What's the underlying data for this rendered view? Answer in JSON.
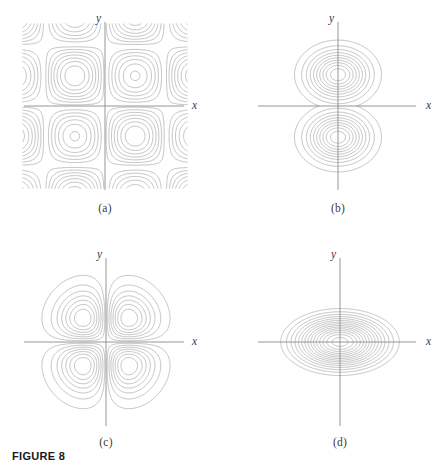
{
  "figure": {
    "caption": "FIGURE 8",
    "axis_label_x": "x",
    "axis_label_y": "y",
    "line_color": "#9b9b9b",
    "axis_color": "#8a8a8a",
    "text_color": "#3b3b3b",
    "background": "#ffffff"
  },
  "panels": [
    {
      "id": "a",
      "label": "(a)",
      "position": {
        "left": 0,
        "top": 0
      },
      "origin": {
        "x": 105,
        "y": 106
      },
      "axis_x": {
        "from": 24,
        "to": 184
      },
      "axis_y": {
        "from": 22,
        "to": 190
      },
      "x_label_pos": {
        "x": 192,
        "y": 109
      },
      "y_label_pos": {
        "x": 101,
        "y": 22
      }
    },
    {
      "id": "b",
      "label": "(b)",
      "position": {
        "left": 224,
        "top": 0
      },
      "origin": {
        "x": 114,
        "y": 106
      },
      "axis_x": {
        "from": 34,
        "to": 192
      },
      "axis_y": {
        "from": 22,
        "to": 190
      },
      "x_label_pos": {
        "x": 202,
        "y": 109
      },
      "y_label_pos": {
        "x": 110,
        "y": 22
      }
    },
    {
      "id": "c",
      "label": "(c)",
      "position": {
        "left": 0,
        "top": 234
      },
      "origin": {
        "x": 106,
        "y": 108
      },
      "axis_x": {
        "from": 24,
        "to": 184
      },
      "axis_y": {
        "from": 24,
        "to": 192
      },
      "x_label_pos": {
        "x": 192,
        "y": 111
      },
      "y_label_pos": {
        "x": 102,
        "y": 24
      }
    },
    {
      "id": "d",
      "label": "(d)",
      "position": {
        "left": 224,
        "top": 234
      },
      "origin": {
        "x": 116,
        "y": 108
      },
      "axis_x": {
        "from": 34,
        "to": 192
      },
      "axis_y": {
        "from": 24,
        "to": 192
      },
      "x_label_pos": {
        "x": 202,
        "y": 111
      },
      "y_label_pos": {
        "x": 112,
        "y": 24
      }
    }
  ],
  "chart_data": {
    "type": "line",
    "title": "FIGURE 8",
    "xlabel": "x",
    "ylabel": "y",
    "grid": false,
    "legend": null,
    "subplots": [
      {
        "label": "(a)",
        "kind": "contour",
        "shape": "saddle / hyperbolic grid with nested rounded-diamond level curves around the origin",
        "n_contours": 13,
        "extrema": "local extremum at origin; contours open outward toward the four corners",
        "symmetry": "symmetric about both the x-axis and the y-axis",
        "function_hint": "sin(x)*sin(y) type periodic saddle field"
      },
      {
        "label": "(b)",
        "kind": "contour",
        "shape": "hourglass / figure-eight outer boundary with two nested closed families",
        "n_contours": 10,
        "extrema": "two extrema, one above and one below the x-axis on the y-axis; saddle point at the origin",
        "symmetry": "symmetric about both the x-axis and the y-axis",
        "function_hint": "double-well field pinched at the x-axis"
      },
      {
        "label": "(c)",
        "kind": "contour",
        "shape": "four-lobed clover, one nested lobe family in each quadrant",
        "n_contours": 12,
        "extrema": "four extrema, one centered in each quadrant; saddle at the origin",
        "symmetry": "symmetric about both axes and about the origin",
        "function_hint": "x*y*exp(-x^2-y^2) type four-lobe field"
      },
      {
        "label": "(d)",
        "kind": "contour",
        "shape": "concentric ellipses elongated along the x-axis",
        "n_contours": 15,
        "extrema": "single extremum at the origin",
        "symmetry": "symmetric about both the x-axis and the y-axis",
        "function_hint": "elliptic paraboloid / bivariate bump centered at origin"
      }
    ]
  }
}
